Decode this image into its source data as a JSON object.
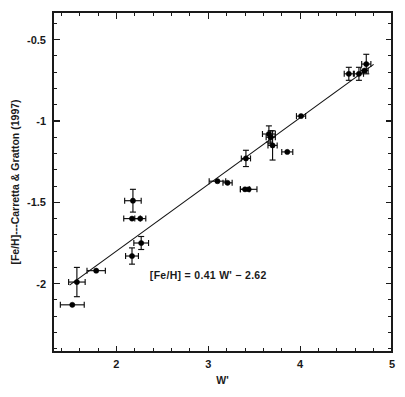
{
  "chart_data": {
    "type": "scatter",
    "title": "",
    "xlabel": "W'",
    "ylabel": "[Fe/H]---Carretta & Gratton (1997)",
    "xlim": [
      1.31,
      5.0
    ],
    "ylim": [
      -2.42,
      -0.33
    ],
    "xticks": [
      2,
      3,
      4,
      5
    ],
    "xticklabels": [
      "2",
      "3",
      "4",
      "5"
    ],
    "yticks": [
      -0.5,
      -1,
      -1.5,
      -2
    ],
    "yticklabels": [
      "-0.5",
      "-1",
      "-1.5",
      "-2"
    ],
    "x_minor_tick_step": 0.2,
    "y_minor_tick_step": 0.1,
    "grid": false,
    "legend": null,
    "annotations": [
      {
        "text": "[Fe/H] = 0.41 W' − 2.62",
        "x": 3.0,
        "y": -1.97
      }
    ],
    "fit": {
      "label": "[Fe/H] = 0.41 W' - 2.62",
      "slope": 0.41,
      "intercept": -2.62,
      "x_start": 1.49,
      "x_end": 4.8,
      "color": "#111111"
    },
    "marker_style": {
      "shape": "circle",
      "color": "#000000",
      "size_px": 5.2
    },
    "points": [
      {
        "x": 1.52,
        "y": -2.13,
        "xerr": 0.13,
        "yerr": 0.0
      },
      {
        "x": 1.57,
        "y": -1.99,
        "xerr": 0.09,
        "yerr": 0.09
      },
      {
        "x": 1.78,
        "y": -1.92,
        "xerr": 0.1,
        "yerr": 0.0
      },
      {
        "x": 2.17,
        "y": -1.83,
        "xerr": 0.07,
        "yerr": 0.05
      },
      {
        "x": 2.17,
        "y": -1.6,
        "xerr": 0.09,
        "yerr": 0.0
      },
      {
        "x": 2.18,
        "y": -1.49,
        "xerr": 0.09,
        "yerr": 0.07
      },
      {
        "x": 2.26,
        "y": -1.6,
        "xerr": 0.06,
        "yerr": 0.0
      },
      {
        "x": 2.27,
        "y": -1.75,
        "xerr": 0.08,
        "yerr": 0.04
      },
      {
        "x": 3.1,
        "y": -1.37,
        "xerr": 0.09,
        "yerr": 0.0
      },
      {
        "x": 3.21,
        "y": -1.38,
        "xerr": 0.05,
        "yerr": 0.0
      },
      {
        "x": 3.4,
        "y": -1.42,
        "xerr": 0.05,
        "yerr": 0.0
      },
      {
        "x": 3.44,
        "y": -1.42,
        "xerr": 0.09,
        "yerr": 0.0
      },
      {
        "x": 3.41,
        "y": -1.23,
        "xerr": 0.05,
        "yerr": 0.05
      },
      {
        "x": 3.66,
        "y": -1.08,
        "xerr": 0.07,
        "yerr": 0.05
      },
      {
        "x": 3.68,
        "y": -1.1,
        "xerr": 0.05,
        "yerr": 0.04
      },
      {
        "x": 3.7,
        "y": -1.15,
        "xerr": 0.05,
        "yerr": 0.09
      },
      {
        "x": 3.86,
        "y": -1.19,
        "xerr": 0.06,
        "yerr": 0.0
      },
      {
        "x": 4.01,
        "y": -0.97,
        "xerr": 0.05,
        "yerr": 0.0
      },
      {
        "x": 4.53,
        "y": -0.71,
        "xerr": 0.05,
        "yerr": 0.04
      },
      {
        "x": 4.64,
        "y": -0.71,
        "xerr": 0.05,
        "yerr": 0.04
      },
      {
        "x": 4.7,
        "y": -0.69,
        "xerr": 0.04,
        "yerr": 0.0
      },
      {
        "x": 4.72,
        "y": -0.65,
        "xerr": 0.05,
        "yerr": 0.06
      }
    ]
  }
}
